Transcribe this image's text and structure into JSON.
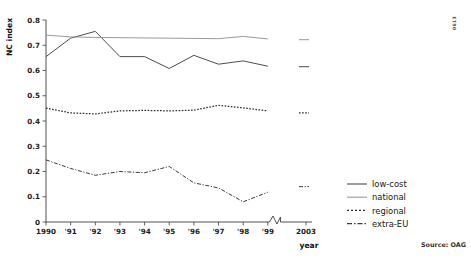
{
  "chart_data": {
    "type": "line",
    "title": "",
    "xlabel": "year",
    "ylabel": "NC index",
    "ylim": [
      0,
      0.8
    ],
    "ytick_labels": [
      "0",
      "0.1",
      "0.2",
      "0.3",
      "0.4",
      "0.5",
      "0.6",
      "0.7",
      "0.8"
    ],
    "ytick_values": [
      0,
      0.1,
      0.2,
      0.3,
      0.4,
      0.5,
      0.6,
      0.7,
      0.8
    ],
    "categories": [
      "1990",
      "'91",
      "'92",
      "'93",
      "'94",
      "'95",
      "'96",
      "'97",
      "'98",
      "'99",
      "2003"
    ],
    "x_axis_break": {
      "present": true,
      "between": [
        "'99",
        "2003"
      ]
    },
    "grid": false,
    "legend_position": "right",
    "series": [
      {
        "name": "low-cost",
        "style": "solid",
        "color": "#4d4d4d",
        "values": [
          0.655,
          0.728,
          0.755,
          0.655,
          0.655,
          0.608,
          0.66,
          0.625,
          0.638,
          0.617,
          0.615
        ]
      },
      {
        "name": "national",
        "style": "solid",
        "color": "#9a9a9a",
        "values": [
          0.74,
          0.733,
          0.731,
          0.73,
          0.729,
          0.728,
          0.727,
          0.726,
          0.735,
          0.725,
          0.722
        ]
      },
      {
        "name": "regional",
        "style": "dotted",
        "color": "#2b2b2b",
        "values": [
          0.451,
          0.432,
          0.428,
          0.44,
          0.442,
          0.44,
          0.443,
          0.462,
          0.452,
          0.44,
          0.432
        ]
      },
      {
        "name": "extra-EU",
        "style": "dashdot",
        "color": "#3a3a3a",
        "values": [
          0.246,
          0.212,
          0.185,
          0.2,
          0.195,
          0.22,
          0.155,
          0.135,
          0.08,
          0.118,
          0.14
        ]
      }
    ]
  },
  "annotations": {
    "source": "Source: OAG",
    "corner_mark": "0613"
  }
}
